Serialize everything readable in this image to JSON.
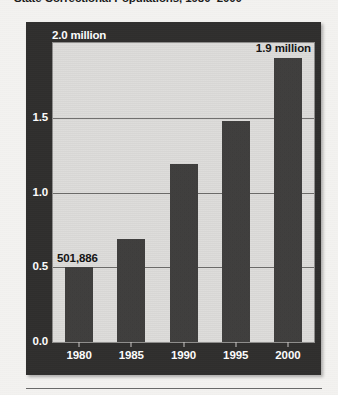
{
  "headline": "State Correctional Populations, 1980–2000",
  "chart_data": {
    "type": "bar",
    "title": "State Correctional Populations, 1980–2000",
    "subtitle": "",
    "xlabel": "",
    "ylabel": "",
    "y_unit": "million",
    "categories": [
      "1980",
      "1985",
      "1990",
      "1995",
      "2000"
    ],
    "values": [
      0.501886,
      0.69,
      1.19,
      1.48,
      1.9
    ],
    "value_labels": [
      "501,886",
      "",
      "",
      "",
      "1.9 million"
    ],
    "ylim": [
      0.0,
      2.0
    ],
    "yticks": [
      0.0,
      0.5,
      1.0,
      1.5,
      2.0
    ],
    "ytick_labels": [
      "0.0",
      "0.5",
      "1.0",
      "1.5",
      "2.0 million"
    ],
    "grid": true,
    "gridlines_at": [
      0.5,
      1.0,
      1.5
    ],
    "legend": null,
    "legend_position": "none",
    "annotations": [
      {
        "category": "1980",
        "text": "501,886",
        "placement": "left-of-bar"
      },
      {
        "category": "2000",
        "text": "1.9 million",
        "placement": "above-bar-right"
      }
    ],
    "colors": {
      "bar": "#3a3938",
      "plot_background": "#dedddb",
      "frame_background": "#2e2d2c",
      "gridline": "#6d6c6a",
      "axis_text": "#ffffff",
      "label_text": "#141414"
    }
  }
}
